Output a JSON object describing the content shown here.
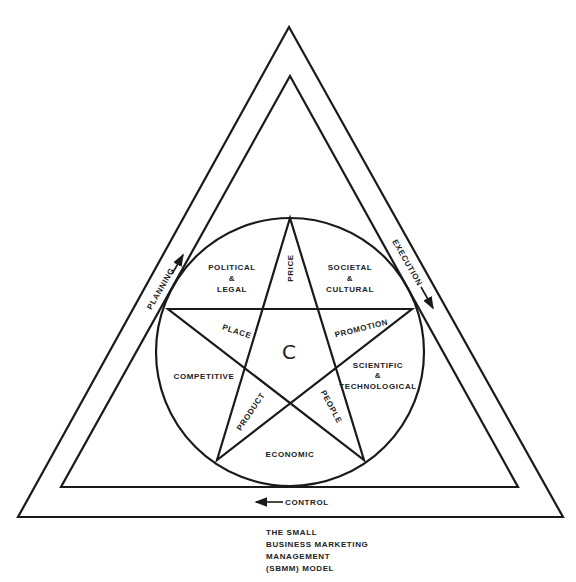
{
  "diagram": {
    "title_lines": [
      "THE SMALL",
      "BUSINESS MARKETING",
      "MANAGEMENT",
      "(SBMM) MODEL"
    ],
    "center_label": "C",
    "triangle_labels": {
      "left": "PLANNING",
      "right": "EXECUTION",
      "bottom": "CONTROL"
    },
    "star_points": {
      "top": "PRICE",
      "upper_left": "PLACE",
      "upper_right": "PROMOTION",
      "lower_left": "PRODUCT",
      "lower_right": "PEOPLE"
    },
    "environment_segments": {
      "political_legal": [
        "POLITICAL",
        "&",
        "LEGAL"
      ],
      "societal_cultural": [
        "SOCIETAL",
        "&",
        "CULTURAL"
      ],
      "competitive": [
        "COMPETITIVE"
      ],
      "scientific_technological": [
        "SCIENTIFIC",
        "&",
        "TECHNOLOGICAL"
      ],
      "economic": [
        "ECONOMIC"
      ]
    },
    "colors": {
      "line": "#1a1a1a",
      "background": "#ffffff"
    }
  }
}
